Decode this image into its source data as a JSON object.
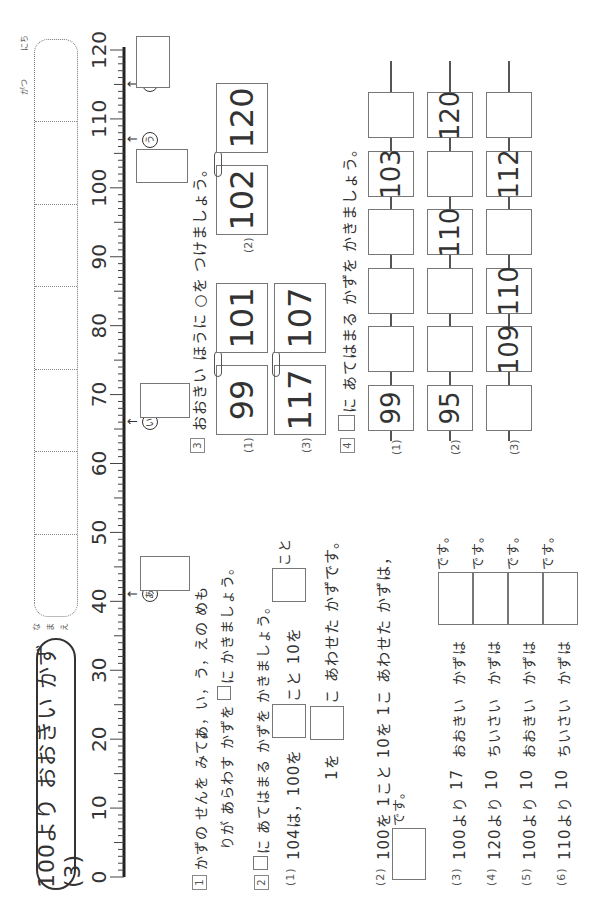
{
  "header": {
    "title": "100より おおきい  かず(3)",
    "name_label": [
      "な",
      "ま",
      "え"
    ],
    "month_label": "がつ",
    "day_label": "にち"
  },
  "number_line": {
    "min": 0,
    "max": 120,
    "labels": [
      "0",
      "10",
      "20",
      "30",
      "40",
      "50",
      "60",
      "70",
      "80",
      "90",
      "100",
      "110",
      "120"
    ],
    "markers": [
      {
        "id": "a",
        "glyph": "あ",
        "value": 41
      },
      {
        "id": "i",
        "glyph": "い",
        "value": 66
      },
      {
        "id": "u",
        "glyph": "う",
        "value": 107
      },
      {
        "id": "e",
        "glyph": "え",
        "value": 115
      }
    ]
  },
  "q1": {
    "number": "1",
    "line1": "かずの  せんを  みて，",
    "line1_marks": "あ，い，う，えの  めも",
    "line2_a": "りが  あらわす  かずを",
    "line2_b": "に  かきましょう。"
  },
  "q2": {
    "number": "2",
    "instr_b": "に  あてはまる  かずを  かきましょう。",
    "p1": {
      "num": "(1)",
      "text_a": "104は，100を",
      "text_b": "こと  10を",
      "text_c": "こと",
      "text_d": "1を",
      "text_e": "こ  あわせた  かずです。"
    },
    "p2": {
      "num": "(2)",
      "text_a": "100を  1こと  10を  1こ  あわせた  かずは，",
      "text_b": "です。"
    },
    "items": [
      {
        "num": "(3)",
        "base": "100より",
        "amount": "17",
        "dir": "おおきい",
        "tail": "かずは",
        "end": "です。"
      },
      {
        "num": "(4)",
        "base": "120より",
        "amount": "10",
        "dir": "ちいさい",
        "tail": "かずは",
        "end": "です。"
      },
      {
        "num": "(5)",
        "base": "100より",
        "amount": "10",
        "dir": "おおきい",
        "tail": "かずは",
        "end": "です。"
      },
      {
        "num": "(6)",
        "base": "110より",
        "amount": "10",
        "dir": "ちいさい",
        "tail": "かずは",
        "end": "です。"
      }
    ]
  },
  "q3": {
    "number": "3",
    "instruction": "おおきい  ほうに  ○を  つけましょう。",
    "pairs": [
      {
        "num": "(1)",
        "left": "99",
        "right": "101"
      },
      {
        "num": "(2)",
        "left": "102",
        "right": "120"
      },
      {
        "num": "(3)",
        "left": "117",
        "right": "107"
      }
    ]
  },
  "q4": {
    "number": "4",
    "instruction": "に  あてはまる  かずを  かきましょう。",
    "rows": [
      {
        "num": "(1)",
        "cells": [
          "99",
          "",
          "",
          "",
          "103",
          ""
        ]
      },
      {
        "num": "(2)",
        "cells": [
          "95",
          "",
          "",
          "110",
          "",
          "120"
        ]
      },
      {
        "num": "(3)",
        "cells": [
          "",
          "109",
          "110",
          "",
          "112",
          ""
        ]
      }
    ]
  }
}
